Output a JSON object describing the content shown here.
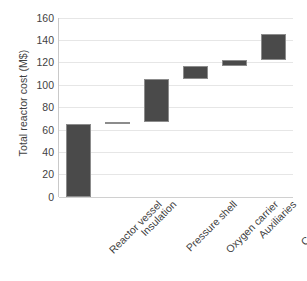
{
  "chart_data": {
    "type": "bar",
    "subtype": "waterfall",
    "title": "",
    "xlabel": "",
    "ylabel": "Total reactor cost (M$)",
    "ylim": [
      0,
      160
    ],
    "ytick_step": 20,
    "yticks": [
      160,
      140,
      120,
      100,
      80,
      60,
      40,
      20,
      0
    ],
    "ytick_labels": [
      "160",
      "140",
      "120",
      "100",
      "80",
      "60",
      "40",
      "20",
      "0"
    ],
    "grid": true,
    "legend": "none",
    "bar_color": "#4a4a4a",
    "bar_edge_color": "#8c8c8c",
    "grid_color": "#e6e6e6",
    "axis_color": "#c9c9c9",
    "text_color": "#3f3f3f",
    "categories": [
      "Reactor vessel",
      "Insulation",
      "Pressure shell",
      "Oxygen carrier",
      "Auxiliaries",
      "Contingency"
    ],
    "values": [
      65,
      2,
      38,
      12,
      5,
      23
    ],
    "bar_bottoms": [
      0,
      65,
      67,
      105,
      117,
      122
    ],
    "bar_tops": [
      65,
      67,
      105,
      117,
      122,
      145
    ],
    "cumulative": [
      65,
      67,
      105,
      117,
      122,
      145
    ]
  }
}
